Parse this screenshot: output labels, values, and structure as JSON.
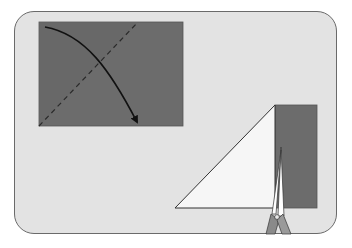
{
  "figure": {
    "colors": {
      "background": "#ffffff",
      "panel": "#e3e3e3",
      "panel_border": "#6a6a6a",
      "paper_dark": "#6c6c6c",
      "paper_light": "#f6f6f6",
      "scissors": "#8a8a8a"
    },
    "step1": {
      "label": "fold diagonally",
      "icons": [
        "fold-arrow-icon",
        "dashed-fold-line"
      ]
    },
    "step2": {
      "label": "cut off excess strip",
      "icons": [
        "folded-triangle",
        "scissors-icon"
      ]
    }
  }
}
